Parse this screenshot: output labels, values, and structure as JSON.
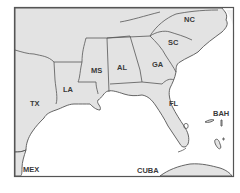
{
  "map": {
    "region": "Southeastern United States and Gulf of Mexico",
    "colors": {
      "land": "#e3e3e3",
      "water": "#ffffff",
      "border": "#555555",
      "label": "#3a3a3a"
    },
    "labels": {
      "nc": "NC",
      "sc": "SC",
      "ga": "GA",
      "al": "AL",
      "ms": "MS",
      "la": "LA",
      "tx": "TX",
      "fl": "FL",
      "bah": "BAH",
      "cuba": "CUBA",
      "mex": "MEX"
    }
  }
}
